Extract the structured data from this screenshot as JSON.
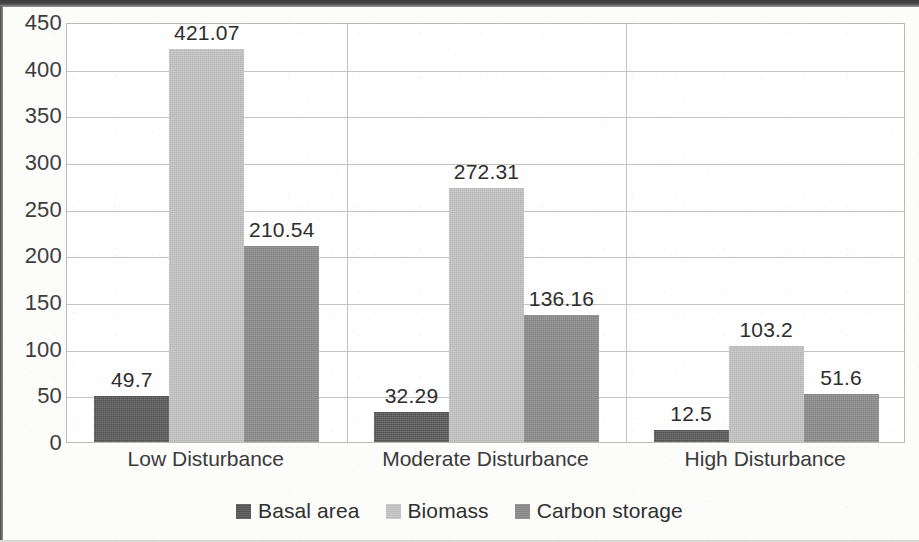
{
  "chart_data": {
    "type": "bar",
    "title": "",
    "subtitle": "",
    "xlabel": "",
    "ylabel": "",
    "categories": [
      "Low Disturbance",
      "Moderate Disturbance",
      "High Disturbance"
    ],
    "series": [
      {
        "name": "Basal area",
        "color": "#575757",
        "values": [
          49.7,
          32.29,
          12.5
        ]
      },
      {
        "name": "Biomass",
        "color": "#c4c4c4",
        "values": [
          421.07,
          272.31,
          103.2
        ]
      },
      {
        "name": "Carbon storage",
        "color": "#8a8a8a",
        "values": [
          210.54,
          136.16,
          51.6
        ]
      }
    ],
    "data_labels": [
      [
        "49.7",
        "421.07",
        "210.54"
      ],
      [
        "32.29",
        "272.31",
        "136.16"
      ],
      [
        "12.5",
        "103.2",
        "51.6"
      ]
    ],
    "ylim": [
      0,
      450
    ],
    "yticks": [
      0,
      50,
      100,
      150,
      200,
      250,
      300,
      350,
      400,
      450
    ],
    "ytick_labels": [
      "0",
      "50",
      "100",
      "150",
      "200",
      "250",
      "300",
      "350",
      "400",
      "450"
    ],
    "grid": "horizontal-and-category-separators",
    "legend_position": "bottom",
    "legend_entries": [
      "Basal area",
      "Biomass",
      "Carbon storage"
    ],
    "colors": {
      "basal_area": "#575757",
      "biomass": "#c4c4c4",
      "carbon_storage": "#8a8a8a",
      "gridline": "#c3c3c3",
      "text": "#3c3c3c",
      "plot_background": "#fefefe",
      "page_background": "#fcfcfb"
    }
  }
}
